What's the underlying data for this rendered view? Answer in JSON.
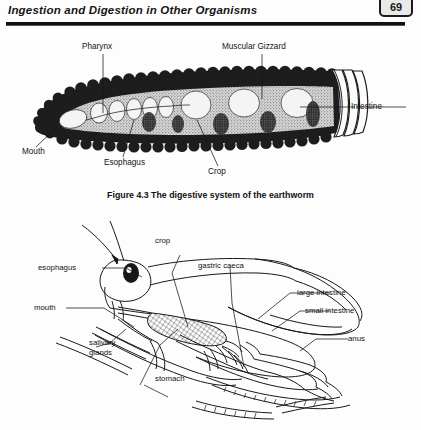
{
  "header": {
    "title": "Ingestion and Digestion in Other Organisms",
    "page_number": "69"
  },
  "figure1": {
    "caption": "Figure 4.3 The digestive system of the earthworm",
    "labels": {
      "pharynx": "Pharynx",
      "muscular_gizzard": "Muscular Gizzard",
      "intestine": "Intestine",
      "mouth": "Mouth",
      "esophagus": "Esophagus",
      "crop": "Crop"
    }
  },
  "figure2": {
    "labels": {
      "crop": "crop",
      "esophagus": "esophagus",
      "gastric_caeca": "gastric caeca",
      "large_intestine": "large intestine",
      "small_intestine": "small intestine",
      "mouth": "mouth",
      "anus": "anus",
      "salivary_glands_line1": "salivary",
      "salivary_glands_line2": "glands",
      "stomach": "stomach"
    }
  },
  "colors": {
    "ink": "#161616",
    "rule": "#111111",
    "paper": "#fdfdfd",
    "organ_light": "#f2f2f2",
    "organ_mid": "#b8b8b8"
  }
}
